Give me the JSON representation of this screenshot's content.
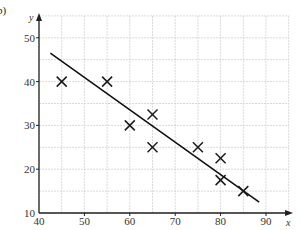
{
  "part_label": "b)",
  "chart_data": {
    "type": "scatter",
    "title": "",
    "xlabel": "x",
    "ylabel": "y",
    "xlim": [
      40,
      95
    ],
    "ylim": [
      10,
      55
    ],
    "x_ticks": [
      40,
      50,
      60,
      70,
      80,
      90
    ],
    "y_ticks": [
      10,
      20,
      30,
      40,
      50
    ],
    "grid": true,
    "grid_step": 5,
    "legend": null,
    "series": [
      {
        "name": "data points",
        "marker": "x",
        "points": [
          {
            "x": 45,
            "y": 40
          },
          {
            "x": 55,
            "y": 40
          },
          {
            "x": 60,
            "y": 30
          },
          {
            "x": 65,
            "y": 32.5
          },
          {
            "x": 65,
            "y": 25
          },
          {
            "x": 75,
            "y": 25
          },
          {
            "x": 80,
            "y": 22.5
          },
          {
            "x": 80,
            "y": 17.5
          },
          {
            "x": 85,
            "y": 15
          }
        ]
      },
      {
        "name": "line of best fit",
        "type": "line",
        "points": [
          {
            "x": 42.5,
            "y": 46.5
          },
          {
            "x": 88.5,
            "y": 12.5
          }
        ]
      }
    ]
  },
  "colors": {
    "axis": "#222222",
    "grid": "#cfcfcf",
    "marker": "#1a1a1a",
    "line": "#111111"
  }
}
